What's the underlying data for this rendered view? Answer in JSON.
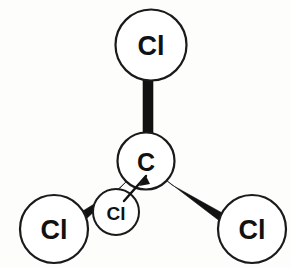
{
  "diagram": {
    "molecule": "CCl4",
    "background_color": "#fdfdfc",
    "stroke_color": "#1a1a1a",
    "fill_color": "#ffffff",
    "bond_color": "#111111",
    "atoms": [
      {
        "id": "carbon-center",
        "label": "C",
        "element": "C",
        "cx": 146,
        "cy": 161,
        "r": 28.5,
        "font_size": 25,
        "stroke_width": 2.2
      },
      {
        "id": "chlorine-top",
        "label": "Cl",
        "element": "Cl",
        "cx": 151,
        "cy": 45,
        "r": 35.5,
        "font_size": 27,
        "stroke_width": 2.2
      },
      {
        "id": "chlorine-bottom-left",
        "label": "Cl",
        "element": "Cl",
        "cx": 54,
        "cy": 229,
        "r": 34,
        "font_size": 27,
        "stroke_width": 2.2
      },
      {
        "id": "chlorine-bottom-right",
        "label": "Cl",
        "element": "Cl",
        "cx": 252,
        "cy": 229,
        "r": 34,
        "font_size": 27,
        "stroke_width": 2.2
      },
      {
        "id": "chlorine-back-small",
        "label": "Cl",
        "element": "Cl",
        "cx": 116,
        "cy": 212,
        "r": 23,
        "font_size": 19,
        "stroke_width": 2.0
      }
    ],
    "bonds": [
      {
        "id": "bond-c-cl-top",
        "from": "carbon-center",
        "to": "chlorine-top",
        "type": "plain-bar",
        "points": "143,80 153,80 153,135 143,135"
      },
      {
        "id": "bond-c-cl-bottom-left",
        "from": "carbon-center",
        "to": "chlorine-bottom-left",
        "type": "wedge",
        "points": "128,180 120,188 78,214 84,221"
      },
      {
        "id": "bond-c-cl-bottom-right",
        "from": "carbon-center",
        "to": "chlorine-bottom-right",
        "type": "wedge",
        "points": "166,180 172,185 224,214 221,222"
      },
      {
        "id": "bond-c-cl-back",
        "from": "carbon-center",
        "to": "chlorine-back-small",
        "type": "thin-line",
        "points": "146,176 124,201"
      }
    ],
    "bond_count": 4
  }
}
